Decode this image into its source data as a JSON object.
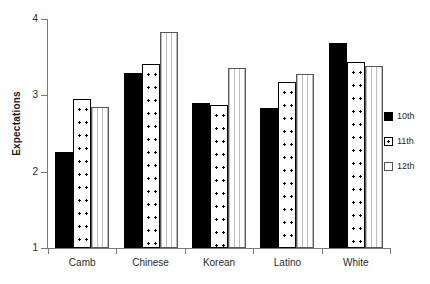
{
  "chart_data": {
    "type": "bar",
    "title": "",
    "xlabel": "",
    "ylabel": "Expectations",
    "ylim": [
      1,
      4
    ],
    "yticks": [
      1,
      2,
      3,
      4
    ],
    "ytick_labels": [
      "1",
      "2",
      "3",
      "4"
    ],
    "grid": false,
    "legend_position": "right",
    "categories": [
      "Camb",
      "Chinese",
      "Korean",
      "Latino",
      "White"
    ],
    "series": [
      {
        "name": "10th",
        "fill": "solid-black",
        "values": [
          2.26,
          3.29,
          2.9,
          2.83,
          3.69
        ]
      },
      {
        "name": "11th",
        "fill": "dotted-white",
        "values": [
          2.95,
          3.41,
          2.87,
          3.18,
          3.44
        ]
      },
      {
        "name": "12th",
        "fill": "lined-white",
        "values": [
          2.85,
          3.83,
          3.36,
          3.28,
          3.39
        ]
      }
    ]
  },
  "legend": {
    "items": [
      {
        "label": "10th"
      },
      {
        "label": "11th"
      },
      {
        "label": "12th"
      }
    ]
  },
  "colors": {
    "series_10th": "#000000",
    "series_11th": "#ffffff",
    "series_12th": "#ffffff",
    "axis": "#7a7a7a",
    "text": "#2b2b2b",
    "background": "#ffffff"
  }
}
